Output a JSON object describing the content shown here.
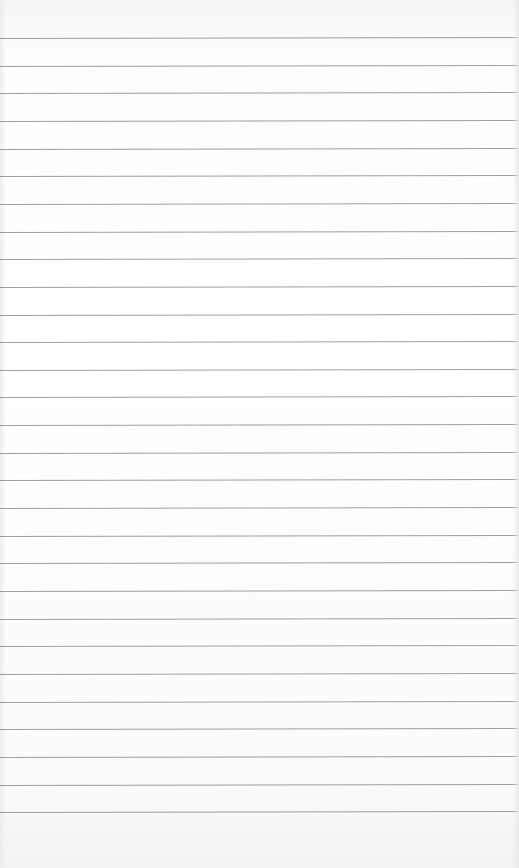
{
  "image": {
    "subject": "blank lined notebook paper",
    "text": ""
  },
  "paper": {
    "background_color": "#ffffff",
    "line_color": "#8e8e8e",
    "line_count": 29,
    "first_line_y": 38,
    "line_spacing_px": 27.65
  }
}
